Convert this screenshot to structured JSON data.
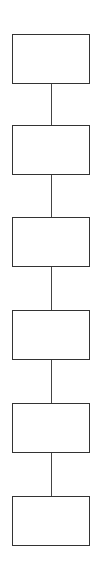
{
  "diagram": {
    "type": "vertical-flow",
    "stroke_color": "#333333",
    "background": "#ffffff",
    "nodes": [
      {
        "id": "node-1",
        "label": "",
        "top": 34
      },
      {
        "id": "node-2",
        "label": "",
        "top": 125
      },
      {
        "id": "node-3",
        "label": "",
        "top": 217
      },
      {
        "id": "node-4",
        "label": "",
        "top": 310
      },
      {
        "id": "node-5",
        "label": "",
        "top": 403
      },
      {
        "id": "node-6",
        "label": "",
        "top": 496
      }
    ],
    "edges": [
      {
        "from": "node-1",
        "to": "node-2"
      },
      {
        "from": "node-2",
        "to": "node-3"
      },
      {
        "from": "node-3",
        "to": "node-4"
      },
      {
        "from": "node-4",
        "to": "node-5"
      },
      {
        "from": "node-5",
        "to": "node-6"
      }
    ]
  }
}
